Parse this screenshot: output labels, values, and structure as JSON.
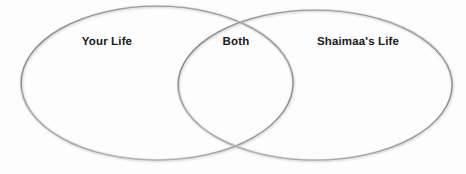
{
  "diagram": {
    "type": "venn-2-set",
    "title": "",
    "background_color": "#fcfcfc",
    "stroke_color": "#8a8a8a",
    "label_color": "#1b1b1b",
    "regions": [
      {
        "id": "left",
        "label": "Your Life",
        "role": "left-set-only"
      },
      {
        "id": "center",
        "label": "Both",
        "role": "intersection"
      },
      {
        "id": "right",
        "label": "Shaimaa's Life",
        "role": "right-set-only"
      }
    ],
    "circles": [
      {
        "id": "left-ellipse",
        "cx": 157,
        "cy": 83,
        "rx": 136,
        "ry": 77
      },
      {
        "id": "right-ellipse",
        "cx": 315,
        "cy": 85,
        "rx": 137,
        "ry": 75
      }
    ]
  }
}
